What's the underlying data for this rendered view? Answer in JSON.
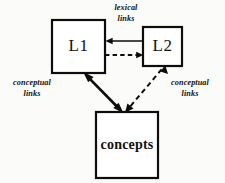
{
  "figure": {
    "background_color": "#fbfbfa",
    "stroke_color": "#0d0d0d",
    "fill_color": "#ffffff"
  },
  "nodes": [
    {
      "id": "l1",
      "label": "L1",
      "x": 52,
      "y": 20,
      "width": 53,
      "height": 53,
      "border_width": 2.2
    },
    {
      "id": "l2",
      "label": "L2",
      "x": 143,
      "y": 27,
      "width": 39,
      "height": 39,
      "border_width": 2.2
    },
    {
      "id": "concepts",
      "label": "concepts",
      "x": 96,
      "y": 112,
      "width": 62,
      "height": 66,
      "border_width": 2.2
    }
  ],
  "edge_labels": [
    {
      "id": "lexical-links",
      "line1": "lexical",
      "line2": "links",
      "x": 126,
      "y": 8
    },
    {
      "id": "conceptual-links-left",
      "line1": "conceptual",
      "line2": "links",
      "x": 32,
      "y": 83
    },
    {
      "id": "conceptual-links-right",
      "line1": "conceptual",
      "line2": "links",
      "x": 190,
      "y": 83
    }
  ],
  "edges": [
    {
      "id": "l2-to-l1-lexical",
      "style": "solid",
      "stroke_width": 1.6,
      "from": "L2",
      "to": "L1",
      "arrowheads": "end",
      "x1": 143,
      "y1": 41,
      "x2": 107,
      "y2": 41
    },
    {
      "id": "l1-to-l2-lexical",
      "style": "dashed",
      "stroke_width": 1.8,
      "from": "L1",
      "to": "L2",
      "arrowheads": "end",
      "x1": 106,
      "y1": 55,
      "x2": 141,
      "y2": 55
    },
    {
      "id": "l1-concepts-conceptual",
      "style": "solid",
      "stroke_width": 2.6,
      "from": "L1",
      "to": "concepts",
      "arrowheads": "both",
      "x1": 84,
      "y1": 73,
      "x2": 122,
      "y2": 112
    },
    {
      "id": "l2-concepts-conceptual",
      "style": "dashed",
      "stroke_width": 2.0,
      "from": "L2",
      "to": "concepts",
      "arrowheads": "both",
      "x1": 164,
      "y1": 66,
      "x2": 126,
      "y2": 112
    }
  ]
}
